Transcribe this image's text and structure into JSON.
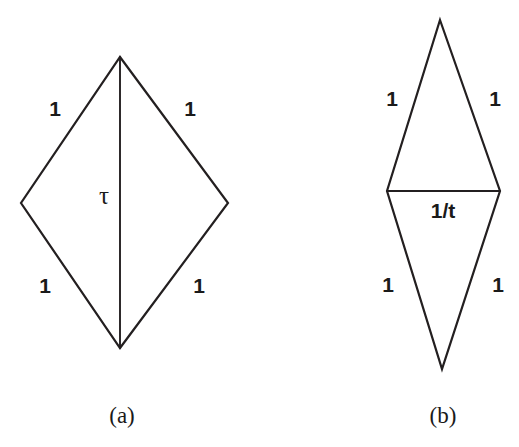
{
  "figure": {
    "background_color": "#ffffff",
    "stroke_color": "#231f20",
    "text_color": "#1a1a1a",
    "panels": [
      {
        "id": "a",
        "caption": "(a)",
        "shape": "rhombus",
        "description": "wide rhombus split by a vertical diagonal",
        "vertices": {
          "top": [
            120,
            57
          ],
          "left": [
            21,
            203
          ],
          "right": [
            228,
            203
          ],
          "bottom": [
            120,
            348
          ]
        },
        "inner_line": {
          "kind": "vertical-diagonal",
          "from": [
            120,
            57
          ],
          "to": [
            120,
            348
          ],
          "label": "τ",
          "label_pos": [
            104,
            198
          ]
        },
        "edge_labels": [
          {
            "name": "upper-left",
            "text": "1",
            "pos": [
              55,
              110
            ]
          },
          {
            "name": "upper-right",
            "text": "1",
            "pos": [
              190,
              110
            ]
          },
          {
            "name": "lower-left",
            "text": "1",
            "pos": [
              45,
              287
            ]
          },
          {
            "name": "lower-right",
            "text": "1",
            "pos": [
              199,
              287
            ]
          }
        ],
        "caption_pos": [
          122,
          418
        ]
      },
      {
        "id": "b",
        "caption": "(b)",
        "shape": "rhombus",
        "description": "narrow tall rhombus split by a horizontal diagonal",
        "vertices": {
          "top": [
            440,
            20
          ],
          "left": [
            387,
            191
          ],
          "right": [
            500,
            191
          ],
          "bottom": [
            442,
            369
          ]
        },
        "inner_line": {
          "kind": "horizontal-diagonal",
          "from": [
            387,
            191
          ],
          "to": [
            500,
            191
          ],
          "label": "1/t",
          "label_pos": [
            443,
            212
          ]
        },
        "edge_labels": [
          {
            "name": "upper-left",
            "text": "1",
            "pos": [
              392,
              100
            ]
          },
          {
            "name": "upper-right",
            "text": "1",
            "pos": [
              495,
              100
            ]
          },
          {
            "name": "lower-left",
            "text": "1",
            "pos": [
              388,
              286
            ]
          },
          {
            "name": "lower-right",
            "text": "1",
            "pos": [
              498,
              286
            ]
          }
        ],
        "caption_pos": [
          443,
          418
        ]
      }
    ]
  }
}
